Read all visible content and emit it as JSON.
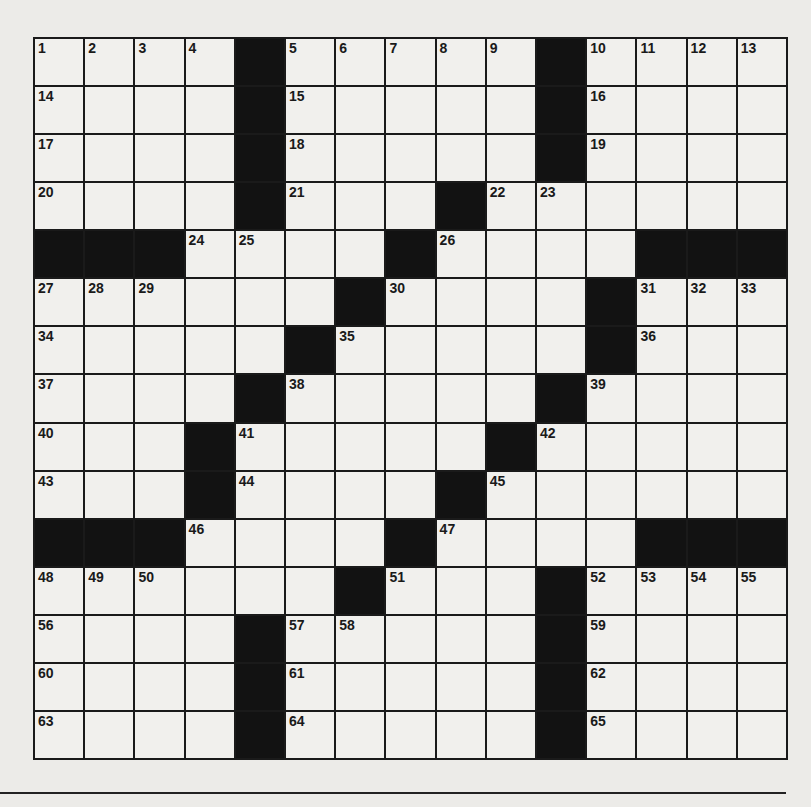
{
  "puzzle": {
    "rows": 15,
    "cols": 15,
    "colors": {
      "block": "#121212",
      "cell": "#f1f0ed",
      "line": "#1a1a1a"
    },
    "grid": [
      "....#.....#....",
      "....#.....#....",
      "....#.....#....",
      "....#...#......",
      "###....#....###",
      "......#....#...",
      ".....#.....#...",
      "....#.....#....",
      "...#.....#.....",
      "...#....#......",
      "###....#....###",
      "......#...#....",
      "....#.....#....",
      "....#.....#....",
      "....#.....#...."
    ],
    "numbers": [
      {
        "r": 0,
        "c": 0,
        "n": "1"
      },
      {
        "r": 0,
        "c": 1,
        "n": "2"
      },
      {
        "r": 0,
        "c": 2,
        "n": "3"
      },
      {
        "r": 0,
        "c": 3,
        "n": "4"
      },
      {
        "r": 0,
        "c": 5,
        "n": "5"
      },
      {
        "r": 0,
        "c": 6,
        "n": "6"
      },
      {
        "r": 0,
        "c": 7,
        "n": "7"
      },
      {
        "r": 0,
        "c": 8,
        "n": "8"
      },
      {
        "r": 0,
        "c": 9,
        "n": "9"
      },
      {
        "r": 0,
        "c": 11,
        "n": "10"
      },
      {
        "r": 0,
        "c": 12,
        "n": "11"
      },
      {
        "r": 0,
        "c": 13,
        "n": "12"
      },
      {
        "r": 0,
        "c": 14,
        "n": "13"
      },
      {
        "r": 1,
        "c": 0,
        "n": "14"
      },
      {
        "r": 1,
        "c": 5,
        "n": "15"
      },
      {
        "r": 1,
        "c": 11,
        "n": "16"
      },
      {
        "r": 2,
        "c": 0,
        "n": "17"
      },
      {
        "r": 2,
        "c": 5,
        "n": "18"
      },
      {
        "r": 2,
        "c": 11,
        "n": "19"
      },
      {
        "r": 3,
        "c": 0,
        "n": "20"
      },
      {
        "r": 3,
        "c": 5,
        "n": "21"
      },
      {
        "r": 3,
        "c": 9,
        "n": "22"
      },
      {
        "r": 3,
        "c": 10,
        "n": "23"
      },
      {
        "r": 4,
        "c": 3,
        "n": "24"
      },
      {
        "r": 4,
        "c": 4,
        "n": "25"
      },
      {
        "r": 4,
        "c": 8,
        "n": "26"
      },
      {
        "r": 5,
        "c": 0,
        "n": "27"
      },
      {
        "r": 5,
        "c": 1,
        "n": "28"
      },
      {
        "r": 5,
        "c": 2,
        "n": "29"
      },
      {
        "r": 5,
        "c": 7,
        "n": "30"
      },
      {
        "r": 5,
        "c": 12,
        "n": "31"
      },
      {
        "r": 5,
        "c": 13,
        "n": "32"
      },
      {
        "r": 5,
        "c": 14,
        "n": "33"
      },
      {
        "r": 6,
        "c": 0,
        "n": "34"
      },
      {
        "r": 6,
        "c": 6,
        "n": "35"
      },
      {
        "r": 6,
        "c": 12,
        "n": "36"
      },
      {
        "r": 7,
        "c": 0,
        "n": "37"
      },
      {
        "r": 7,
        "c": 5,
        "n": "38"
      },
      {
        "r": 7,
        "c": 11,
        "n": "39"
      },
      {
        "r": 8,
        "c": 0,
        "n": "40"
      },
      {
        "r": 8,
        "c": 4,
        "n": "41"
      },
      {
        "r": 8,
        "c": 10,
        "n": "42"
      },
      {
        "r": 9,
        "c": 0,
        "n": "43"
      },
      {
        "r": 9,
        "c": 4,
        "n": "44"
      },
      {
        "r": 9,
        "c": 9,
        "n": "45"
      },
      {
        "r": 10,
        "c": 3,
        "n": "46"
      },
      {
        "r": 10,
        "c": 8,
        "n": "47"
      },
      {
        "r": 11,
        "c": 0,
        "n": "48"
      },
      {
        "r": 11,
        "c": 1,
        "n": "49"
      },
      {
        "r": 11,
        "c": 2,
        "n": "50"
      },
      {
        "r": 11,
        "c": 7,
        "n": "51"
      },
      {
        "r": 11,
        "c": 11,
        "n": "52"
      },
      {
        "r": 11,
        "c": 12,
        "n": "53"
      },
      {
        "r": 11,
        "c": 13,
        "n": "54"
      },
      {
        "r": 11,
        "c": 14,
        "n": "55"
      },
      {
        "r": 12,
        "c": 0,
        "n": "56"
      },
      {
        "r": 12,
        "c": 5,
        "n": "57"
      },
      {
        "r": 12,
        "c": 6,
        "n": "58"
      },
      {
        "r": 12,
        "c": 11,
        "n": "59"
      },
      {
        "r": 13,
        "c": 0,
        "n": "60"
      },
      {
        "r": 13,
        "c": 5,
        "n": "61"
      },
      {
        "r": 13,
        "c": 11,
        "n": "62"
      },
      {
        "r": 14,
        "c": 0,
        "n": "63"
      },
      {
        "r": 14,
        "c": 5,
        "n": "64"
      },
      {
        "r": 14,
        "c": 11,
        "n": "65"
      }
    ]
  }
}
